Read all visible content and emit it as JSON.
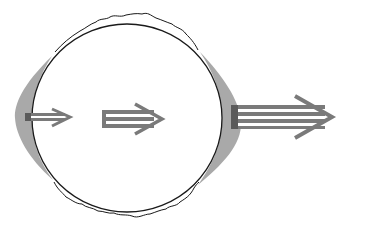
{
  "diagram": {
    "colors": {
      "background": "#ffffff",
      "outline": "#1a1a1a",
      "crescent": "#a9a9a9",
      "arrow": "#7a7a7a",
      "stripe": "#ffffff"
    },
    "elements": [
      {
        "name": "circle",
        "shape": "circle"
      },
      {
        "name": "wavy-top-edge",
        "shape": "wavy-arc"
      },
      {
        "name": "wavy-bottom-edge",
        "shape": "wavy-arc"
      },
      {
        "name": "left-crescent",
        "shape": "crescent"
      },
      {
        "name": "right-crescent",
        "shape": "crescent"
      },
      {
        "name": "small-arrow",
        "shape": "arrow",
        "stripes": 1
      },
      {
        "name": "medium-arrow",
        "shape": "arrow",
        "stripes": 1
      },
      {
        "name": "large-arrow",
        "shape": "arrow",
        "stripes": 3
      }
    ]
  }
}
